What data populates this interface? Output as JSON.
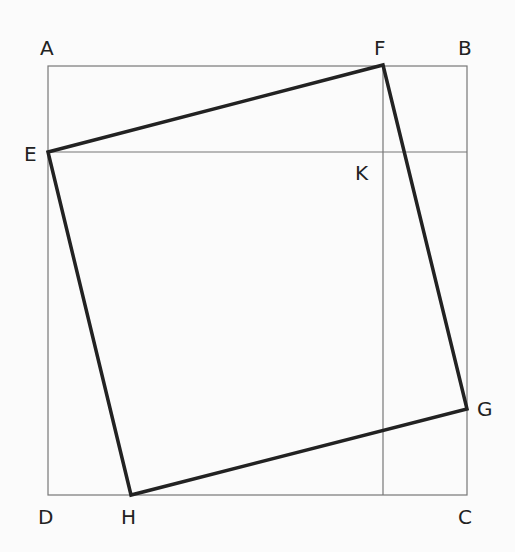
{
  "labels": {
    "A": "A",
    "B": "B",
    "C": "C",
    "D": "D",
    "E": "E",
    "F": "F",
    "G": "G",
    "H": "H",
    "K": "K"
  },
  "colors": {
    "thin_line": "#777777",
    "thick_line": "#222222",
    "background": "#fbfbfb"
  }
}
